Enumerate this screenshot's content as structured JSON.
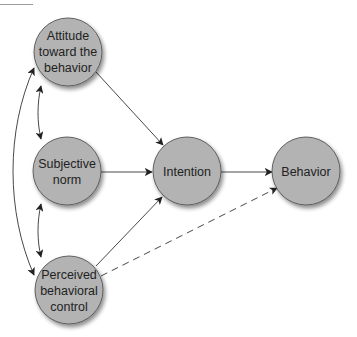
{
  "diagram": {
    "type": "path-model",
    "colors": {
      "node_fill": "#b3b3b3",
      "node_stroke": "#555555",
      "edge": "#333333",
      "text": "#222222"
    },
    "nodes": [
      {
        "id": "attitude",
        "lines": [
          "Attitude",
          "toward the",
          "behavior"
        ],
        "cx": 68,
        "cy": 52,
        "r": 34
      },
      {
        "id": "subjective_norm",
        "lines": [
          "Subjective",
          "norm"
        ],
        "cx": 67,
        "cy": 171,
        "r": 34
      },
      {
        "id": "pbc",
        "lines": [
          "Perceived",
          "behavioral",
          "control"
        ],
        "cx": 69,
        "cy": 290,
        "r": 34
      },
      {
        "id": "intention",
        "lines": [
          "Intention"
        ],
        "cx": 187,
        "cy": 171,
        "r": 34
      },
      {
        "id": "behavior",
        "lines": [
          "Behavior"
        ],
        "cx": 306,
        "cy": 171,
        "r": 34
      }
    ],
    "edges": [
      {
        "from": "attitude",
        "to": "intention",
        "style": "solid",
        "directed": true
      },
      {
        "from": "subjective_norm",
        "to": "intention",
        "style": "solid",
        "directed": true
      },
      {
        "from": "pbc",
        "to": "intention",
        "style": "solid",
        "directed": true
      },
      {
        "from": "intention",
        "to": "behavior",
        "style": "solid",
        "directed": true
      },
      {
        "from": "pbc",
        "to": "behavior",
        "style": "dashed",
        "directed": true
      },
      {
        "from": "attitude",
        "to": "subjective_norm",
        "style": "solid",
        "directed": "both"
      },
      {
        "from": "subjective_norm",
        "to": "pbc",
        "style": "solid",
        "directed": "both"
      },
      {
        "from": "attitude",
        "to": "pbc",
        "style": "solid",
        "directed": "both"
      }
    ]
  },
  "labels": {
    "attitude": [
      "Attitude",
      "toward the",
      "behavior"
    ],
    "subjective_norm": [
      "Subjective",
      "norm"
    ],
    "pbc": [
      "Perceived",
      "behavioral",
      "control"
    ],
    "intention": "Intention",
    "behavior": "Behavior"
  }
}
